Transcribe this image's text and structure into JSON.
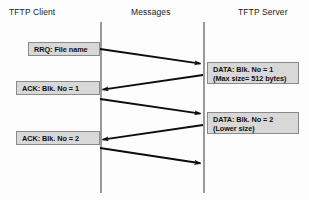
{
  "headers": {
    "client": "TFTP Client",
    "messages": "Messages",
    "server": "TFTP Server"
  },
  "messages": {
    "rrq": "RRQ: File name",
    "data1_line1": "DATA: Blk. No = 1",
    "data1_line2": "(Max size= 512 bytes)",
    "ack1": "ACK: Blk. No = 1",
    "data2_line1": "DATA: Blk. No = 2",
    "data2_line2": "(Lower size)",
    "ack2": "ACK: Blk. No = 2"
  },
  "colors": {
    "box_fill": "#d8d8d8",
    "box_border": "#8a8a8a",
    "lifeline": "#9a9a9a",
    "arrow": "#0d0d0d",
    "text": "#111111",
    "background": "#fdfdfd"
  },
  "arrows": [
    {
      "name": "rrq-arrow",
      "direction": "right",
      "x1": 100,
      "y1": 49,
      "x2": 203,
      "y2": 64
    },
    {
      "name": "data1-arrow",
      "direction": "left",
      "x1": 203,
      "y1": 75,
      "x2": 100,
      "y2": 90
    },
    {
      "name": "ack1-arrow",
      "direction": "right",
      "x1": 100,
      "y1": 99,
      "x2": 203,
      "y2": 114
    },
    {
      "name": "data2-arrow",
      "direction": "left",
      "x1": 203,
      "y1": 125,
      "x2": 100,
      "y2": 140
    },
    {
      "name": "ack2-arrow",
      "direction": "right",
      "x1": 100,
      "y1": 148,
      "x2": 203,
      "y2": 164
    }
  ]
}
